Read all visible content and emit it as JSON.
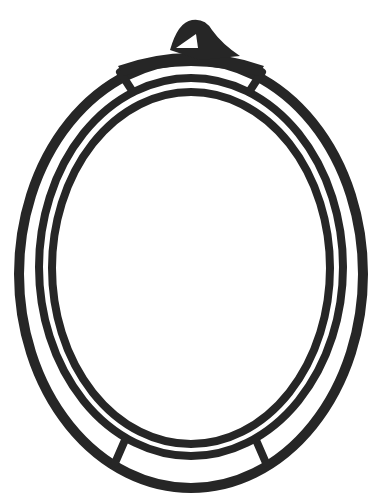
{
  "image": {
    "subject": "oval picture frame line drawing",
    "background": "#ffffff",
    "stroke_color": "#262626"
  },
  "frame": {
    "outer_ring": {
      "cx": 191,
      "cy": 274,
      "rx": 172,
      "ry": 214
    },
    "middle_ring": {
      "cx": 191,
      "cy": 267,
      "rx": 152,
      "ry": 189
    },
    "inner_ring": {
      "cx": 191,
      "cy": 268,
      "rx": 139,
      "ry": 176
    },
    "hanger_loop": {
      "x": 200,
      "y": 30
    }
  }
}
